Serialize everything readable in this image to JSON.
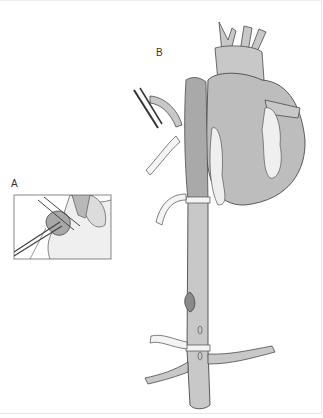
{
  "figure": {
    "panels": [
      {
        "id": "A",
        "label": "A",
        "description": "inset: clamp on tissue"
      },
      {
        "id": "B",
        "label": "B",
        "description": "heart and aorta with vessel loops"
      }
    ],
    "colors": {
      "vessel_fill": "#c8c8c8",
      "vessel_dark": "#a9a9a9",
      "heart_fill": "#bdbdbd",
      "fat_fill": "#efefef",
      "line": "#4a4a4a",
      "tape_fill": "#f4f4f4"
    }
  }
}
